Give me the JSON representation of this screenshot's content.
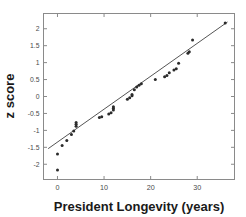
{
  "chart_data": {
    "type": "scatter",
    "title": "",
    "subtitle": "",
    "xlabel": "President Longevity (years)",
    "ylabel": "z score",
    "xlim": [
      -3,
      38
    ],
    "ylim": [
      -2.45,
      2.45
    ],
    "xticks": [
      0,
      10,
      20,
      30
    ],
    "xticklabels": [
      "0",
      "10",
      "20",
      "30"
    ],
    "yticks": [
      -2,
      -1.5,
      -1,
      -0.5,
      0,
      0.5,
      1,
      1.5,
      2
    ],
    "yticklabels": [
      "-2",
      "-1.5",
      "-1",
      "-0.5",
      "0",
      "0.5",
      "1",
      "1.5",
      "2"
    ],
    "grid": false,
    "legend": null,
    "marker": "filled-circle",
    "marker_color": "#2b2b2b",
    "line_color": "#555555",
    "frame_color": "#8a8a8a",
    "x": [
      0,
      0,
      1,
      2,
      3,
      3.5,
      4,
      4,
      4,
      9,
      9.5,
      11,
      11.5,
      12,
      12,
      12,
      15,
      15.5,
      16,
      16,
      16.5,
      17,
      17.5,
      18,
      21,
      23,
      23.5,
      24,
      25,
      25.5,
      26,
      28,
      28.3,
      29,
      36
    ],
    "y": [
      -2.17,
      -1.7,
      -1.45,
      -1.3,
      -1.12,
      -1.02,
      -0.88,
      -0.82,
      -0.77,
      -0.62,
      -0.6,
      -0.52,
      -0.48,
      -0.4,
      -0.35,
      -0.3,
      -0.08,
      -0.04,
      0.02,
      0.06,
      0.2,
      0.28,
      0.33,
      0.38,
      0.5,
      0.58,
      0.62,
      0.7,
      0.78,
      0.82,
      0.98,
      1.28,
      1.32,
      1.67,
      2.17
    ],
    "fit_line": {
      "x1": -2.0,
      "y1": -1.54,
      "x2": 36.5,
      "y2": 2.2
    },
    "series": [
      {
        "name": "president-longevity-z-scores",
        "values": [
          {
            "x": 0,
            "z": -2.17
          },
          {
            "x": 0,
            "z": -1.7
          },
          {
            "x": 1,
            "z": -1.45
          },
          {
            "x": 2,
            "z": -1.3
          },
          {
            "x": 3,
            "z": -1.12
          },
          {
            "x": 3.5,
            "z": -1.02
          },
          {
            "x": 4,
            "z": -0.88
          },
          {
            "x": 4,
            "z": -0.82
          },
          {
            "x": 4,
            "z": -0.77
          },
          {
            "x": 9,
            "z": -0.62
          },
          {
            "x": 9.5,
            "z": -0.6
          },
          {
            "x": 11,
            "z": -0.52
          },
          {
            "x": 11.5,
            "z": -0.48
          },
          {
            "x": 12,
            "z": -0.4
          },
          {
            "x": 12,
            "z": -0.35
          },
          {
            "x": 12,
            "z": -0.3
          },
          {
            "x": 15,
            "z": -0.08
          },
          {
            "x": 15.5,
            "z": -0.04
          },
          {
            "x": 16,
            "z": 0.02
          },
          {
            "x": 16,
            "z": 0.06
          },
          {
            "x": 16.5,
            "z": 0.2
          },
          {
            "x": 17,
            "z": 0.28
          },
          {
            "x": 17.5,
            "z": 0.33
          },
          {
            "x": 18,
            "z": 0.38
          },
          {
            "x": 21,
            "z": 0.5
          },
          {
            "x": 23,
            "z": 0.58
          },
          {
            "x": 23.5,
            "z": 0.62
          },
          {
            "x": 24,
            "z": 0.7
          },
          {
            "x": 25,
            "z": 0.78
          },
          {
            "x": 25.5,
            "z": 0.82
          },
          {
            "x": 26,
            "z": 0.98
          },
          {
            "x": 28,
            "z": 1.28
          },
          {
            "x": 28.3,
            "z": 1.32
          },
          {
            "x": 29,
            "z": 1.67
          },
          {
            "x": 36,
            "z": 2.17
          }
        ]
      }
    ]
  }
}
